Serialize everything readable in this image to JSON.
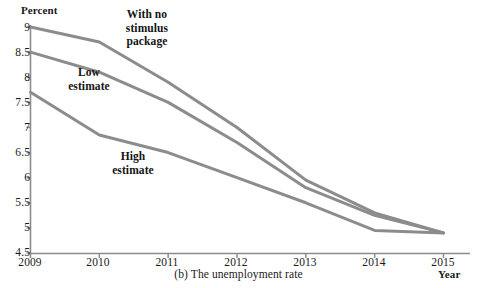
{
  "chart_data": {
    "type": "line",
    "title": "",
    "caption": "(b) The unemployment rate",
    "xlabel": "Year",
    "ylabel": "Percent",
    "x": [
      2009,
      2010,
      2011,
      2012,
      2013,
      2014,
      2015
    ],
    "xtick_labels": [
      "2009",
      "2010",
      "2011",
      "2012",
      "2013",
      "2014",
      "2015"
    ],
    "ytick_labels": [
      "9",
      "8.5",
      "8",
      "7.5",
      "7",
      "6.5",
      "6",
      "5.5",
      "5",
      "4.5"
    ],
    "yticks": [
      9,
      8.5,
      8,
      7.5,
      7,
      6.5,
      6,
      5.5,
      5,
      4.5
    ],
    "ylim": [
      4.5,
      9
    ],
    "xlim": [
      2009,
      2015
    ],
    "grid": false,
    "legend": "annotations",
    "series": [
      {
        "name": "With no stimulus package",
        "color": "#8c8c8c",
        "values": [
          9.0,
          8.7,
          7.9,
          7.0,
          5.95,
          5.3,
          4.9
        ]
      },
      {
        "name": "Low estimate",
        "color": "#8c8c8c",
        "values": [
          8.5,
          8.1,
          7.5,
          6.7,
          5.8,
          5.25,
          4.9
        ]
      },
      {
        "name": "High estimate",
        "color": "#8c8c8c",
        "values": [
          7.7,
          6.85,
          6.5,
          6.0,
          5.5,
          4.95,
          4.9
        ]
      }
    ],
    "annotations": [
      {
        "id": "no-stimulus",
        "text": "With no\nstimulus\npackage"
      },
      {
        "id": "low",
        "text": "Low\nestimate"
      },
      {
        "id": "high",
        "text": "High\nestimate"
      }
    ],
    "axis_color": "#8c8c8c",
    "line_color": "#8c8c8c",
    "line_width": 3
  }
}
